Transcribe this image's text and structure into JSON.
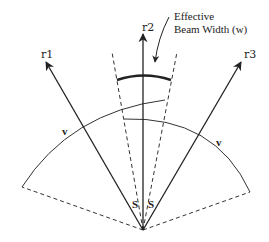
{
  "figure": {
    "rays": [
      {
        "id": "r1",
        "label": "r1"
      },
      {
        "id": "r2",
        "label": "r2"
      },
      {
        "id": "r3",
        "label": "r3"
      }
    ],
    "annotation": {
      "line1": "Effective",
      "line2": "Beam Width (w)"
    },
    "arc_labels": {
      "left": "v",
      "right": "v"
    },
    "angle_labels": {
      "left": "S",
      "right": "S"
    },
    "colors": {
      "stroke": "#222222",
      "background": "#ffffff"
    }
  }
}
